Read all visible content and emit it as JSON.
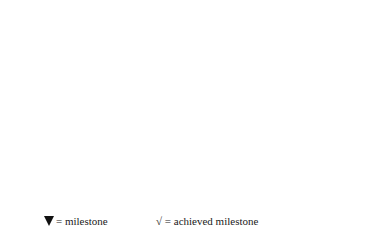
{
  "months": [
    "Apr",
    "May",
    "Jun",
    "Jul",
    "Aug",
    "Sep",
    "Oct"
  ],
  "milestones": [
    {
      "label": "$200",
      "x": 141,
      "y": 28,
      "tx": 147,
      "ty": 40,
      "achieved": true
    },
    {
      "label": "$600",
      "x": 187,
      "y": 28,
      "tx": 194,
      "ty": 40,
      "achieved": true
    },
    {
      "label": "$250",
      "x": 254,
      "y": 28,
      "tx": 262,
      "ty": 40,
      "achieved": false
    },
    {
      "label": "$750",
      "x": 110,
      "y": 59,
      "tx": 116,
      "ty": 71,
      "achieved": true
    },
    {
      "label": "$100",
      "x": 157,
      "y": 59,
      "tx": 163,
      "ty": 71,
      "achieved": true
    },
    {
      "label": "$300",
      "x": 226,
      "y": 59,
      "tx": 227,
      "ty": 71,
      "achieved": false
    },
    {
      "label": "$700",
      "x": 268,
      "y": 59,
      "tx": 273,
      "ty": 71,
      "achieved": false
    },
    {
      "label": "$800",
      "x": 305,
      "y": 59,
      "tx": 310,
      "ty": 71,
      "achieved": false
    },
    {
      "label": "$500",
      "x": 63,
      "y": 90,
      "tx": 70,
      "ty": 102,
      "achieved": true
    },
    {
      "label": "$250",
      "x": 110,
      "y": 90,
      "tx": 116,
      "ty": 102,
      "achieved": true
    },
    {
      "label": "$400",
      "x": 146,
      "y": 90,
      "tx": 152,
      "ty": 102,
      "achieved": true
    },
    {
      "label": "$200",
      "x": 192,
      "y": 90,
      "tx": 197,
      "ty": 102,
      "achieved": false
    },
    {
      "label": "$650",
      "x": 252,
      "y": 90,
      "tx": 257,
      "ty": 102,
      "achieved": false
    },
    {
      "label": "$700",
      "x": 299,
      "y": 90,
      "tx": 304,
      "ty": 102,
      "achieved": false
    },
    {
      "label": "$1000",
      "x": 340,
      "y": 90,
      "tx": 347,
      "ty": 102,
      "achieved": false
    },
    {
      "label": "$300",
      "x": 157,
      "y": 121,
      "tx": 163,
      "ty": 133,
      "achieved": true
    },
    {
      "label": "$300",
      "x": 205,
      "y": 121,
      "tx": 210,
      "ty": 133,
      "achieved": false
    },
    {
      "label": "$600",
      "x": 252,
      "y": 121,
      "tx": 257,
      "ty": 133,
      "achieved": false
    },
    {
      "label": "$400",
      "x": 174,
      "y": 151,
      "tx": 180,
      "ty": 163,
      "achieved": true
    },
    {
      "label": "$600",
      "x": 229,
      "y": 151,
      "tx": 234,
      "ty": 163,
      "achieved": false
    },
    {
      "label": "$400",
      "x": 275,
      "y": 151,
      "tx": 280,
      "ty": 163,
      "achieved": false
    }
  ],
  "ev": {
    "label": "EV",
    "values": [
      "$500",
      "$1500",
      "$2500",
      "$3500",
      "",
      "",
      ""
    ]
  },
  "pv": {
    "label": "PV",
    "values": [
      "$500",
      "$1500",
      "$2500",
      "$4000",
      "$6400",
      "$9000",
      "$10000"
    ]
  },
  "legend": {
    "milestone_symbol": "▼",
    "milestone_text": "= milestone",
    "achieved_symbol": "√",
    "achieved_text": "= achieved milestone"
  },
  "icons": {
    "milestone": "down-triangle",
    "achieved": "check-mark"
  }
}
